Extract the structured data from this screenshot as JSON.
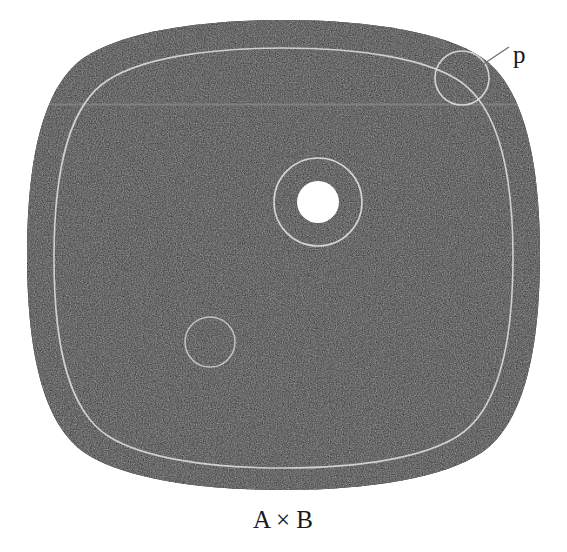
{
  "figure": {
    "caption": "A × B",
    "point_label": "p",
    "background_color": "#ffffff",
    "fiber_bundle_color": "#2b2b2b",
    "outline_color": "#d8d8d8",
    "text_color": "#1a1a1a",
    "base_space_label": "A × B",
    "total_space_shape": "rounded-square-blob",
    "elements": [
      {
        "name": "product-region",
        "kind": "filled-rounded-square",
        "label": "A × B",
        "fill": "#2b2b2b",
        "bounds": {
          "x": 27,
          "y": 20,
          "width": 513,
          "height": 470
        }
      },
      {
        "name": "inner-boundary-curve",
        "kind": "rounded-square-outline",
        "stroke": "#d8d8d8",
        "bounds": {
          "x": 54,
          "y": 48,
          "width": 459,
          "height": 420
        }
      },
      {
        "name": "horizontal-slice-line",
        "kind": "line",
        "stroke": "#8d8d8d",
        "y": 104,
        "x1": 32,
        "x2": 537
      },
      {
        "name": "point-neighborhood-circle",
        "kind": "circle-outline",
        "label": "p",
        "stroke": "#d8d8d8",
        "center": {
          "x": 462,
          "y": 78
        },
        "radius": 27
      },
      {
        "name": "leader-line-p",
        "kind": "line",
        "stroke": "#6b6b6b",
        "x1": 479,
        "y1": 66,
        "x2": 508,
        "y2": 48
      },
      {
        "name": "fiber-annulus-outer-circle",
        "kind": "circle-outline",
        "stroke": "#d8d8d8",
        "center": {
          "x": 318,
          "y": 202
        },
        "radius": 44
      },
      {
        "name": "fiber-disk",
        "kind": "circle-filled",
        "fill": "#ffffff",
        "center": {
          "x": 318,
          "y": 202
        },
        "radius": 21
      },
      {
        "name": "small-neighborhood-circle",
        "kind": "circle-outline",
        "stroke": "#d8d8d8",
        "center": {
          "x": 210,
          "y": 342
        },
        "radius": 25
      }
    ]
  }
}
